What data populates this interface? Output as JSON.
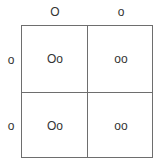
{
  "punnett_square": {
    "column_alleles": [
      "O",
      "o"
    ],
    "row_alleles": [
      "o",
      "o"
    ],
    "cells": [
      [
        "Oo",
        "oo"
      ],
      [
        "Oo",
        "oo"
      ]
    ]
  }
}
